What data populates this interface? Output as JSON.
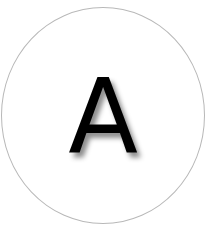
{
  "badge": {
    "letter": "A",
    "border_color": "#b8b8b8",
    "background_color": "#ffffff",
    "letter_color": "#000000"
  }
}
